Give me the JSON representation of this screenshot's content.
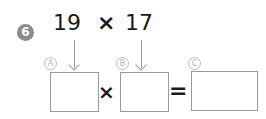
{
  "problem": {
    "number": "6",
    "operand_a": "19",
    "operator": "×",
    "operand_b": "17"
  },
  "equation": {
    "label_a": "A",
    "label_b": "B",
    "label_c": "C",
    "times_sign": "×",
    "equals_sign": "=",
    "box_a_value": "",
    "box_b_value": "",
    "box_c_value": ""
  }
}
